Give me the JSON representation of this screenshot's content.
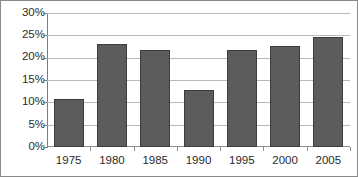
{
  "chart_data": {
    "type": "bar",
    "title": "",
    "subtitle": "",
    "xlabel": "",
    "ylabel": "",
    "categories": [
      "1975",
      "1980",
      "1985",
      "1990",
      "1995",
      "2000",
      "2005"
    ],
    "values": [
      10.8,
      23.0,
      21.8,
      12.7,
      21.7,
      22.6,
      24.7
    ],
    "series": [
      {
        "name": "",
        "values": [
          10.8,
          23.0,
          21.8,
          12.7,
          21.7,
          22.6,
          24.7
        ]
      }
    ],
    "ylim": [
      0,
      30
    ],
    "ytick_values": [
      0,
      5,
      10,
      15,
      20,
      25,
      30
    ],
    "ytick_labels": [
      "0%",
      "5%",
      "10%",
      "15%",
      "20%",
      "25%",
      "30%"
    ],
    "xtick_labels": [
      "1975",
      "1980",
      "1985",
      "1990",
      "1995",
      "2000",
      "2005"
    ],
    "grid": true,
    "grid_axis": "y",
    "legend": false,
    "legend_position": "none",
    "annotations": [],
    "colors": {
      "bar_fill": "#5c5c5c",
      "bar_border": "#3d3d3d",
      "gridline": "#b9b9b9",
      "axis": "#7c7c7c",
      "frame": "#8a8a8a",
      "text": "#2a2a2a",
      "background": "#ffffff"
    }
  }
}
